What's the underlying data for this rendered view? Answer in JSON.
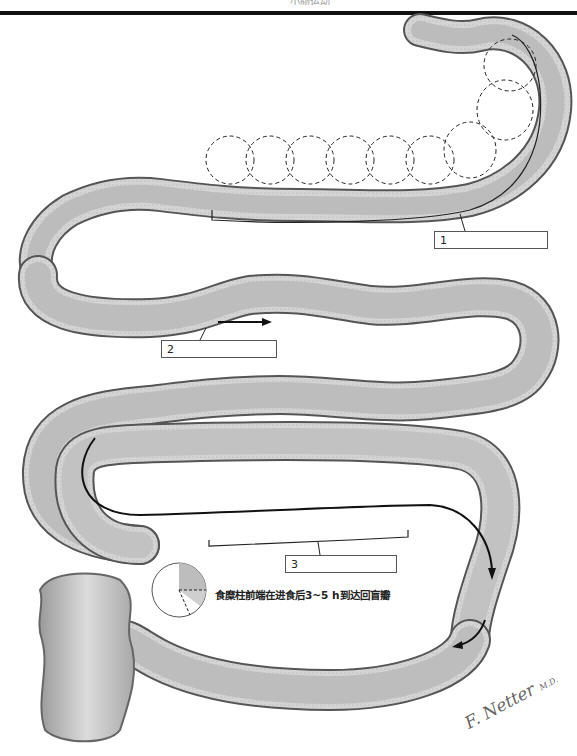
{
  "header": {
    "title_fragment": "小肠运动"
  },
  "figure": {
    "wall_color": "#c8c8c8",
    "lumen_color": "#bdbdbd",
    "outline_color": "#555555"
  },
  "labels": [
    {
      "id": "1",
      "text": "1"
    },
    {
      "id": "2",
      "text": "2"
    },
    {
      "id": "3",
      "text": "3"
    }
  ],
  "clock_icon": {
    "meaning": "time-elapsed",
    "shaded_hours_start": 0,
    "shaded_hours_end": 3,
    "extra_shaded_hours_end": 4
  },
  "caption": "食糜柱前端在进食后3~5 h到达回盲瓣",
  "signature": {
    "name": "F. Netter",
    "suffix": "M.D."
  }
}
